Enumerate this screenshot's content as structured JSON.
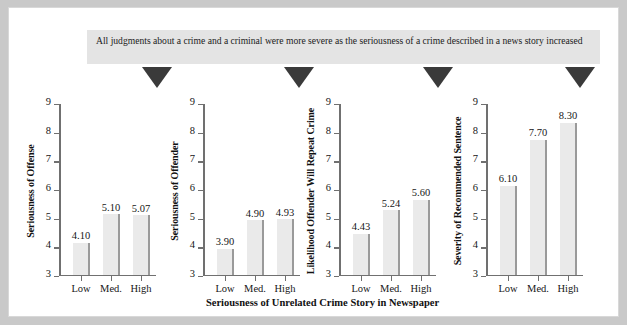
{
  "figure": {
    "caption": "All judgments about a crime and a criminal were more severe as the seriousness of a crime described in a news story increased",
    "xaxis_caption": "Seriousness of Unrelated Crime Story in Newspaper",
    "marker_icon": "down-triangle-icon",
    "marker_count": 4,
    "frame_color": "#c9c9c9",
    "caption_bg": "#e4e4e4",
    "bar_fill": "#eaeaea",
    "bar_edge": "#9a9a9a",
    "axis_color": "#707070"
  },
  "chart_data": [
    {
      "type": "bar",
      "title": "",
      "ylabel": "Seriousness of Offense",
      "xlabel": "Seriousness of Unrelated Crime Story in Newspaper",
      "categories": [
        "Low",
        "Med.",
        "High"
      ],
      "values": [
        4.1,
        5.1,
        5.07
      ],
      "value_labels": [
        "4.10",
        "5.10",
        "5.07"
      ],
      "yticks": [
        3,
        4,
        5,
        6,
        7,
        8,
        9
      ],
      "ytick_labels": [
        "3",
        "4",
        "5",
        "6",
        "7",
        "8",
        "9"
      ],
      "ylim": [
        3,
        9
      ],
      "grid": false,
      "legend": "none"
    },
    {
      "type": "bar",
      "title": "",
      "ylabel": "Seriousness of Offender",
      "xlabel": "Seriousness of Unrelated Crime Story in Newspaper",
      "categories": [
        "Low",
        "Med.",
        "High"
      ],
      "values": [
        3.9,
        4.9,
        4.93
      ],
      "value_labels": [
        "3.90",
        "4.90",
        "4.93"
      ],
      "yticks": [
        3,
        4,
        5,
        6,
        7,
        8,
        9
      ],
      "ytick_labels": [
        "3",
        "4",
        "5",
        "6",
        "7",
        "8",
        "9"
      ],
      "ylim": [
        3,
        9
      ],
      "grid": false,
      "legend": "none"
    },
    {
      "type": "bar",
      "title": "",
      "ylabel": "Likelihood Offender Will Repeat Crime",
      "xlabel": "Seriousness of Unrelated Crime Story in Newspaper",
      "categories": [
        "Low",
        "Med.",
        "High"
      ],
      "values": [
        4.43,
        5.24,
        5.6
      ],
      "value_labels": [
        "4.43",
        "5.24",
        "5.60"
      ],
      "yticks": [
        3,
        4,
        5,
        6,
        7,
        8,
        9
      ],
      "ytick_labels": [
        "3",
        "4",
        "5",
        "6",
        "7",
        "8",
        "9"
      ],
      "ylim": [
        3,
        9
      ],
      "grid": false,
      "legend": "none"
    },
    {
      "type": "bar",
      "title": "",
      "ylabel": "Severity of Recommended Sentence",
      "xlabel": "Seriousness of Unrelated Crime Story in Newspaper",
      "categories": [
        "Low",
        "Med.",
        "High"
      ],
      "values": [
        6.1,
        7.7,
        8.3
      ],
      "value_labels": [
        "6.10",
        "7.70",
        "8.30"
      ],
      "yticks": [
        3,
        4,
        5,
        6,
        7,
        8,
        9
      ],
      "ytick_labels": [
        "3",
        "4",
        "5",
        "6",
        "7",
        "8",
        "9"
      ],
      "ylim": [
        3,
        9
      ],
      "grid": false,
      "legend": "none"
    }
  ]
}
